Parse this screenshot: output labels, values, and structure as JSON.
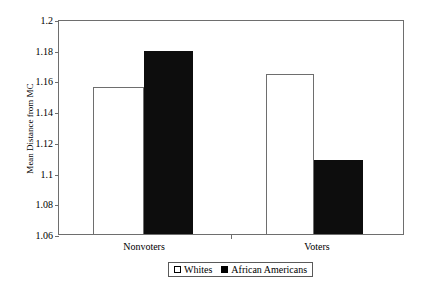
{
  "chart_data": {
    "type": "bar",
    "title": "",
    "xlabel": "",
    "ylabel": "Mean Distance from MC",
    "categories": [
      "Nonvoters",
      "Voters"
    ],
    "series": [
      {
        "name": "Whites",
        "color": "#ffffff",
        "values": [
          1.156,
          1.164
        ]
      },
      {
        "name": "African Americans",
        "color": "#000000",
        "values": [
          1.179,
          1.108
        ]
      }
    ],
    "ylim": [
      1.06,
      1.2
    ],
    "ytick_labels": [
      "1.2",
      "1.18",
      "1.16",
      "1.14",
      "1.12",
      "1.1",
      "1.08",
      "1.06"
    ],
    "ytick_values": [
      1.2,
      1.18,
      1.16,
      1.14,
      1.12,
      1.1,
      1.08,
      1.06
    ],
    "grid": false,
    "legend_position": "bottom",
    "legend": [
      {
        "label": "Whites",
        "swatch": "white-square"
      },
      {
        "label": "African Americans",
        "swatch": "black-square"
      }
    ]
  }
}
